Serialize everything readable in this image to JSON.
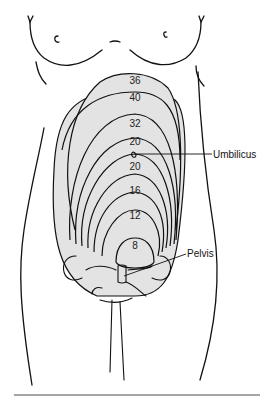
{
  "figure": {
    "weeks": [
      {
        "label": "36",
        "x": 135,
        "y": 84
      },
      {
        "label": "40",
        "x": 135,
        "y": 101
      },
      {
        "label": "32",
        "x": 135,
        "y": 127
      },
      {
        "label": "20",
        "x": 135,
        "y": 145
      },
      {
        "label": "20",
        "x": 135,
        "y": 170
      },
      {
        "label": "16",
        "x": 135,
        "y": 194
      },
      {
        "label": "12",
        "x": 135,
        "y": 219
      },
      {
        "label": "8",
        "x": 135,
        "y": 249
      }
    ],
    "callouts": {
      "umbilicus": "Umbilicus",
      "pelvis": "Pelvis"
    },
    "colors": {
      "fill": "#e3e3e3",
      "line": "#111111",
      "rule": "#888888"
    }
  }
}
